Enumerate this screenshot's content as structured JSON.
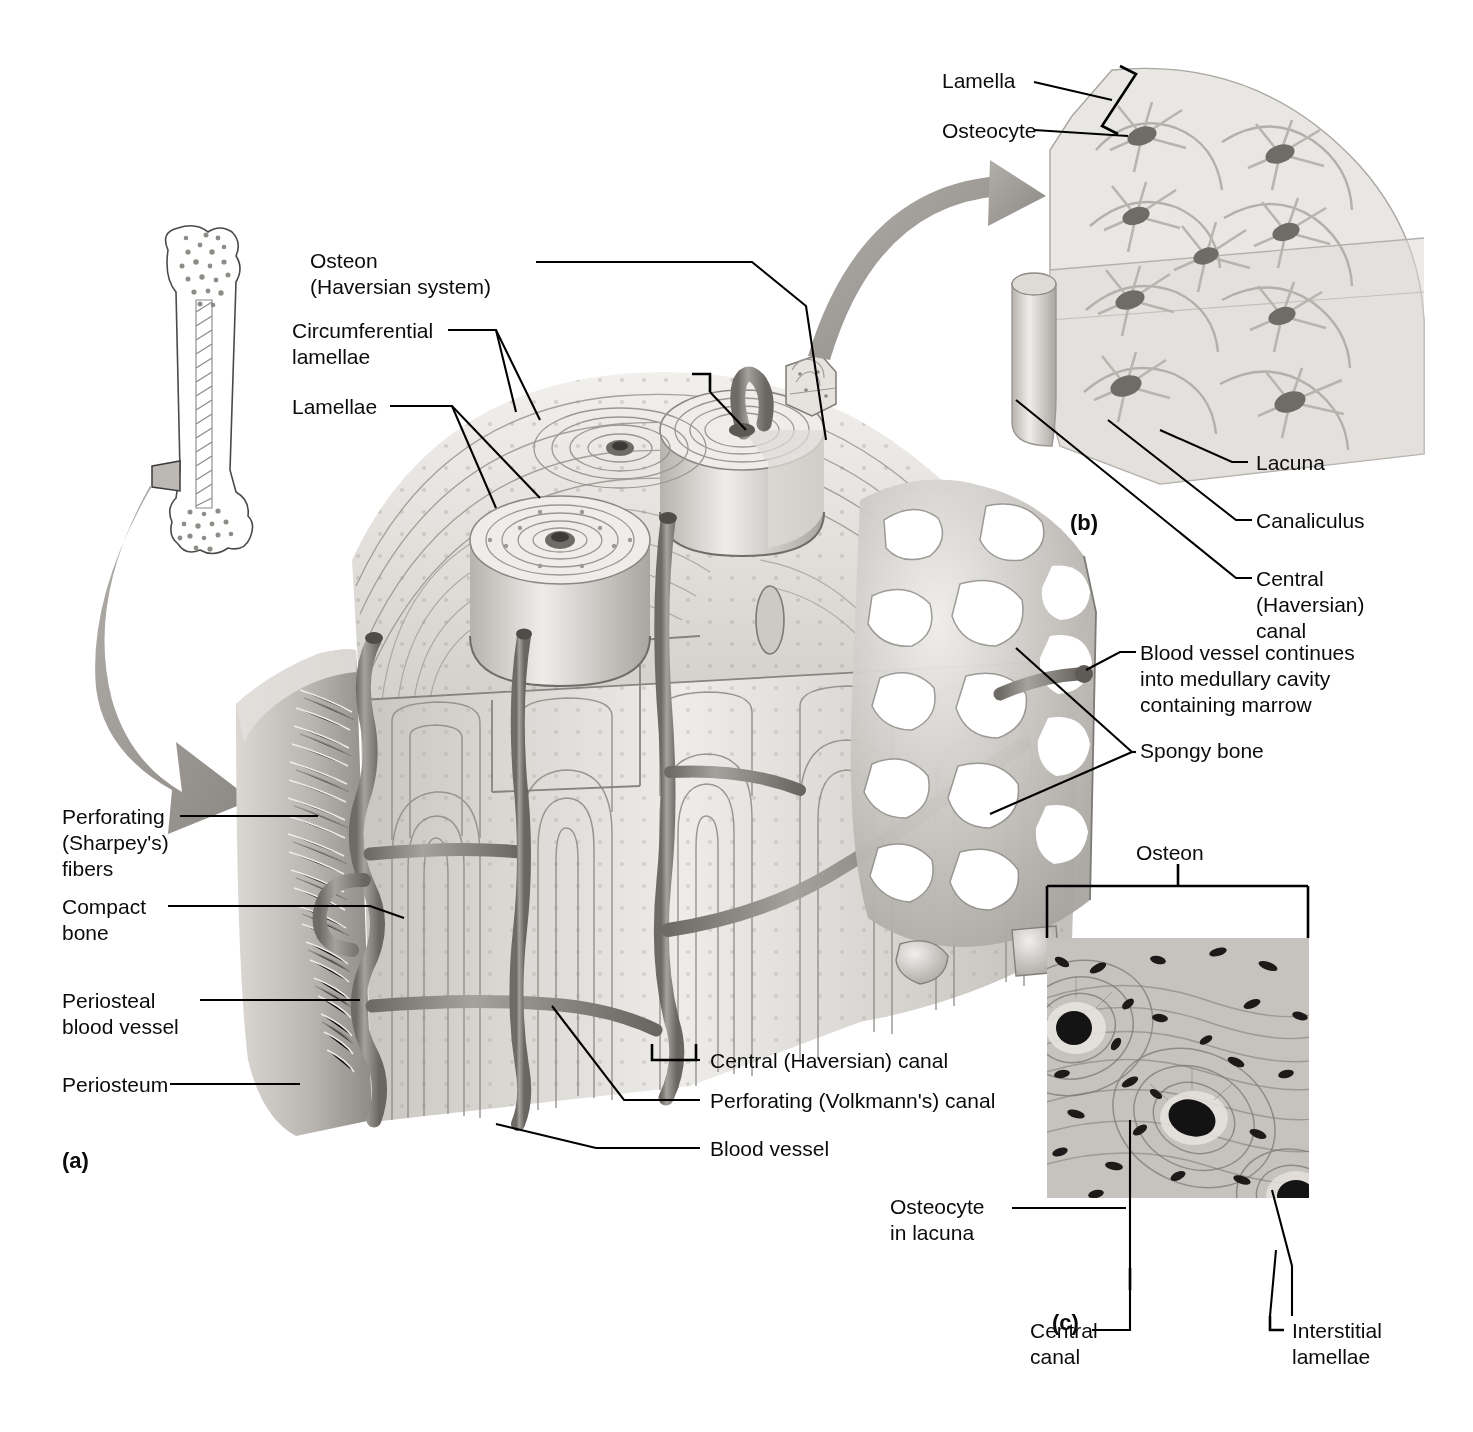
{
  "figure": {
    "panels": [
      {
        "id": "a",
        "label": "(a)",
        "caption": "Diagrammatic view of a pie-shaped segment of compact bone"
      },
      {
        "id": "b",
        "label": "(b)",
        "caption": "Higher magnification view of a portion of one osteon"
      },
      {
        "id": "c",
        "label": "(c)",
        "caption": "Photomicrograph of a cross-sectional view of an osteon"
      }
    ]
  },
  "panel_a": {
    "labels": {
      "osteon": "Osteon\n(Haversian system)",
      "circumferential_lamellae": "Circumferential\nlamellae",
      "lamellae": "Lamellae",
      "perforating_fibers": "Perforating\n(Sharpey's)\nfibers",
      "compact_bone": "Compact\nbone",
      "periosteal_blood_vessel": "Periosteal\nblood vessel",
      "periosteum": "Periosteum",
      "central_canal": "Central (Haversian) canal",
      "perforating_canal": "Perforating (Volkmann's) canal",
      "blood_vessel": "Blood vessel",
      "blood_vessel_medullary": "Blood vessel continues\ninto medullary cavity\ncontaining marrow",
      "spongy_bone": "Spongy bone"
    }
  },
  "panel_b": {
    "labels": {
      "lamella": "Lamella",
      "osteocyte": "Osteocyte",
      "lacuna": "Lacuna",
      "canaliculus": "Canaliculus",
      "central_canal": "Central\n(Haversian)\ncanal"
    }
  },
  "panel_c": {
    "labels": {
      "osteon": "Osteon",
      "osteocyte_in_lacuna": "Osteocyte\nin lacuna",
      "central_canal": "Central\ncanal",
      "interstitial_lamellae": "Interstitial\nlamellae"
    }
  },
  "colors": {
    "bone_light": "#eceae6",
    "bone_mid": "#d8d5d0",
    "bone_shadow": "#a9a6a1",
    "vessel": "#8d8a86",
    "arrow_gray": "#9d9a96",
    "line_black": "#000000",
    "background": "#ffffff"
  }
}
